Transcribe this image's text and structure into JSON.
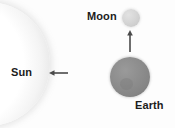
{
  "diagram": {
    "background_color": "#fdfdfd",
    "width": 175,
    "height": 128
  },
  "bodies": {
    "sun": {
      "label": "Sun",
      "icon": "sun-sphere-arc",
      "color": "#ececec",
      "shape": "partial-circle-left-edge"
    },
    "earth": {
      "label": "Earth",
      "icon": "earth-sphere",
      "color": "#8a8a8a",
      "shape": "circle",
      "diameter_px": 40
    },
    "moon": {
      "label": "Moon",
      "icon": "moon-sphere",
      "color": "#d2d2d2",
      "shape": "circle",
      "diameter_px": 18
    }
  },
  "arrows": {
    "sunward": {
      "icon": "arrow-left-icon",
      "direction": "left",
      "color": "#4a4a4a",
      "description": "arrow from Earth region pointing toward the Sun"
    },
    "moonward": {
      "icon": "arrow-up-icon",
      "direction": "up",
      "color": "#4a4a4a",
      "description": "arrow from Earth pointing toward the Moon"
    }
  }
}
